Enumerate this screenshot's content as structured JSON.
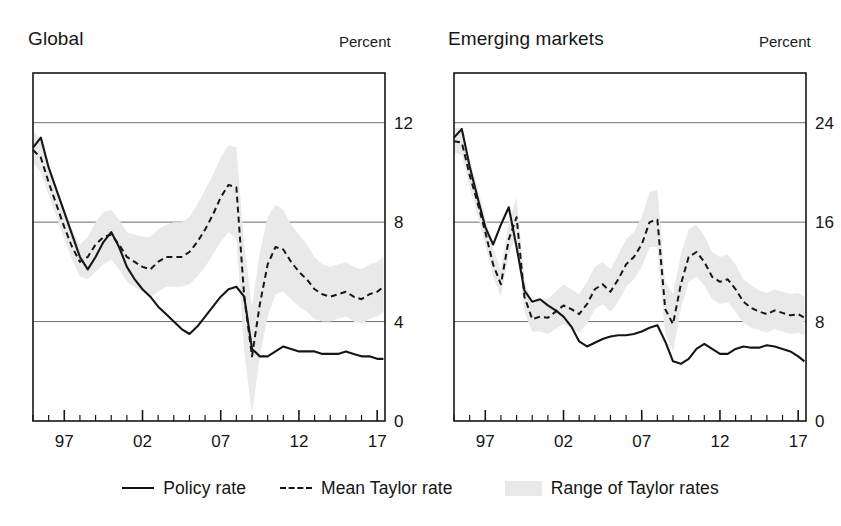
{
  "figure": {
    "background": "#ffffff",
    "ink": "#161616",
    "band_color": "#e9e9e9",
    "gridline_color": "#6e6e6e"
  },
  "panels": [
    {
      "id": "global",
      "title": "Global",
      "unit_label": "Percent",
      "y_ticks": [
        "0",
        "4",
        "8",
        "12"
      ],
      "x_ticks": [
        "97",
        "02",
        "07",
        "12",
        "17"
      ]
    },
    {
      "id": "emerging-markets",
      "title": "Emerging markets",
      "unit_label": "Percent",
      "y_ticks": [
        "0",
        "8",
        "16",
        "24"
      ],
      "x_ticks": [
        "97",
        "02",
        "07",
        "12",
        "17"
      ]
    }
  ],
  "legend": {
    "items": [
      {
        "key": "policy-rate",
        "label": "Policy rate",
        "marker": "solid-line"
      },
      {
        "key": "mean-taylor-rate",
        "label": "Mean Taylor rate",
        "marker": "dashed-line"
      },
      {
        "key": "range-taylor-rates",
        "label": "Range of Taylor rates",
        "marker": "shaded-band"
      }
    ]
  },
  "chart_data": [
    {
      "type": "line",
      "id": "global",
      "title": "Global",
      "xlabel": "",
      "ylabel": "Percent",
      "xlim": [
        1995.0,
        2017.5
      ],
      "ylim": [
        0,
        14
      ],
      "ytick_values": [
        0,
        4,
        8,
        12
      ],
      "ytick_labels": [
        "0",
        "4",
        "8",
        "12"
      ],
      "xtick_values": [
        1997,
        2002,
        2007,
        2012,
        2017
      ],
      "xtick_labels": [
        "97",
        "02",
        "07",
        "12",
        "17"
      ],
      "minor_xtick_step": 1,
      "grid": "horizontal",
      "legend_position": "below-figure",
      "x": [
        1995.0,
        1995.5,
        1996.0,
        1996.5,
        1997.0,
        1997.5,
        1998.0,
        1998.5,
        1999.0,
        1999.5,
        2000.0,
        2000.5,
        2001.0,
        2001.5,
        2002.0,
        2002.5,
        2003.0,
        2003.5,
        2004.0,
        2004.5,
        2005.0,
        2005.5,
        2006.0,
        2006.5,
        2007.0,
        2007.5,
        2008.0,
        2008.5,
        2009.0,
        2009.5,
        2010.0,
        2010.5,
        2011.0,
        2011.5,
        2012.0,
        2012.5,
        2013.0,
        2013.5,
        2014.0,
        2014.5,
        2015.0,
        2015.5,
        2016.0,
        2016.5,
        2017.0,
        2017.4
      ],
      "series": [
        {
          "name": "Policy rate",
          "style": "solid",
          "values": [
            11.0,
            11.4,
            10.2,
            9.3,
            8.4,
            7.5,
            6.6,
            6.1,
            6.6,
            7.2,
            7.6,
            7.0,
            6.2,
            5.7,
            5.3,
            5.0,
            4.6,
            4.3,
            4.0,
            3.7,
            3.5,
            3.8,
            4.2,
            4.6,
            5.0,
            5.3,
            5.4,
            5.0,
            2.9,
            2.6,
            2.6,
            2.8,
            3.0,
            2.9,
            2.8,
            2.8,
            2.8,
            2.7,
            2.7,
            2.7,
            2.8,
            2.7,
            2.6,
            2.6,
            2.5,
            2.5
          ]
        },
        {
          "name": "Mean Taylor rate",
          "style": "dashed",
          "values": [
            10.9,
            10.6,
            9.6,
            8.7,
            7.8,
            7.0,
            6.4,
            6.6,
            7.1,
            7.4,
            7.5,
            7.1,
            6.6,
            6.4,
            6.2,
            6.1,
            6.4,
            6.6,
            6.6,
            6.6,
            6.8,
            7.2,
            7.7,
            8.3,
            9.0,
            9.5,
            9.4,
            5.0,
            2.6,
            4.7,
            6.3,
            7.0,
            6.9,
            6.4,
            6.0,
            5.7,
            5.3,
            5.1,
            5.0,
            5.1,
            5.2,
            5.0,
            4.9,
            5.1,
            5.2,
            5.4
          ]
        }
      ],
      "band": {
        "name": "Range of Taylor rates",
        "color": "#e9e9e9",
        "lower": [
          10.4,
          10.0,
          9.1,
          8.2,
          7.3,
          6.5,
          5.8,
          5.7,
          6.0,
          6.3,
          6.5,
          6.1,
          5.6,
          5.4,
          5.2,
          5.0,
          5.2,
          5.4,
          5.4,
          5.4,
          5.5,
          5.8,
          6.2,
          6.7,
          7.2,
          7.6,
          7.3,
          2.8,
          0.3,
          2.6,
          4.2,
          5.1,
          5.2,
          4.9,
          4.6,
          4.4,
          4.1,
          4.0,
          4.0,
          4.1,
          4.2,
          4.0,
          3.9,
          4.1,
          4.2,
          4.4
        ],
        "upper": [
          11.7,
          11.3,
          10.3,
          9.4,
          8.5,
          7.7,
          7.1,
          7.4,
          8.0,
          8.4,
          8.5,
          8.1,
          7.6,
          7.5,
          7.4,
          7.4,
          7.7,
          7.9,
          8.0,
          8.0,
          8.2,
          8.7,
          9.3,
          9.9,
          10.6,
          11.1,
          11.0,
          7.1,
          4.6,
          6.8,
          8.2,
          8.7,
          8.5,
          7.9,
          7.5,
          7.1,
          6.6,
          6.3,
          6.2,
          6.3,
          6.4,
          6.2,
          6.1,
          6.3,
          6.4,
          6.6
        ]
      }
    },
    {
      "type": "line",
      "id": "emerging-markets",
      "title": "Emerging markets",
      "xlabel": "",
      "ylabel": "Percent",
      "xlim": [
        1995.0,
        2017.5
      ],
      "ylim": [
        0,
        28
      ],
      "ytick_values": [
        0,
        8,
        16,
        24
      ],
      "ytick_labels": [
        "0",
        "8",
        "16",
        "24"
      ],
      "xtick_values": [
        1997,
        2002,
        2007,
        2012,
        2017
      ],
      "xtick_labels": [
        "97",
        "02",
        "07",
        "12",
        "17"
      ],
      "minor_xtick_step": 1,
      "grid": "horizontal",
      "legend_position": "below-figure",
      "x": [
        1995.0,
        1995.5,
        1996.0,
        1996.5,
        1997.0,
        1997.5,
        1998.0,
        1998.5,
        1999.0,
        1999.5,
        2000.0,
        2000.5,
        2001.0,
        2001.5,
        2002.0,
        2002.5,
        2003.0,
        2003.5,
        2004.0,
        2004.5,
        2005.0,
        2005.5,
        2006.0,
        2006.5,
        2007.0,
        2007.5,
        2008.0,
        2008.5,
        2009.0,
        2009.5,
        2010.0,
        2010.5,
        2011.0,
        2011.5,
        2012.0,
        2012.5,
        2013.0,
        2013.5,
        2014.0,
        2014.5,
        2015.0,
        2015.5,
        2016.0,
        2016.5,
        2017.0,
        2017.4
      ],
      "series": [
        {
          "name": "Policy rate",
          "style": "solid",
          "values": [
            22.8,
            23.5,
            20.5,
            18.0,
            15.6,
            14.2,
            15.8,
            17.2,
            14.0,
            10.5,
            9.6,
            9.8,
            9.3,
            8.9,
            8.4,
            7.6,
            6.4,
            6.0,
            6.3,
            6.6,
            6.8,
            6.9,
            6.9,
            7.0,
            7.2,
            7.5,
            7.7,
            6.4,
            4.8,
            4.6,
            5.0,
            5.8,
            6.2,
            5.8,
            5.4,
            5.4,
            5.8,
            6.0,
            5.9,
            5.9,
            6.1,
            6.0,
            5.8,
            5.6,
            5.2,
            4.8
          ]
        },
        {
          "name": "Mean Taylor rate",
          "style": "dashed",
          "values": [
            22.5,
            22.4,
            19.8,
            17.6,
            15.2,
            12.6,
            11.0,
            14.6,
            16.4,
            10.0,
            8.2,
            8.4,
            8.3,
            8.8,
            9.3,
            9.0,
            8.6,
            9.4,
            10.6,
            11.0,
            10.4,
            11.4,
            12.6,
            13.2,
            14.2,
            16.0,
            16.2,
            9.0,
            7.8,
            11.0,
            13.2,
            13.6,
            12.8,
            11.6,
            11.2,
            11.4,
            10.6,
            9.6,
            9.1,
            8.8,
            8.6,
            8.9,
            8.7,
            8.5,
            8.6,
            8.3
          ]
        }
      ],
      "band": {
        "name": "Range of Taylor rates",
        "color": "#e9e9e9",
        "lower": [
          21.6,
          21.4,
          18.8,
          16.6,
          14.2,
          11.6,
          10.0,
          13.4,
          15.0,
          8.8,
          7.2,
          7.2,
          7.0,
          7.4,
          7.8,
          7.5,
          7.1,
          7.8,
          9.0,
          9.4,
          8.8,
          9.6,
          10.8,
          11.4,
          12.4,
          14.0,
          14.0,
          7.0,
          5.6,
          9.0,
          11.2,
          11.6,
          10.9,
          9.8,
          9.4,
          9.6,
          8.8,
          7.9,
          7.5,
          7.3,
          7.1,
          7.4,
          7.2,
          7.0,
          7.1,
          6.9
        ],
        "upper": [
          23.6,
          23.6,
          21.0,
          18.8,
          16.4,
          13.8,
          12.2,
          16.0,
          18.0,
          11.4,
          9.4,
          9.8,
          9.8,
          10.4,
          11.0,
          10.6,
          10.2,
          11.2,
          12.4,
          12.8,
          12.2,
          13.4,
          14.6,
          15.2,
          16.4,
          18.4,
          18.6,
          11.2,
          10.2,
          13.4,
          15.4,
          15.8,
          14.9,
          13.6,
          13.2,
          13.4,
          12.6,
          11.4,
          10.9,
          10.5,
          10.3,
          10.6,
          10.4,
          10.2,
          10.3,
          10.0
        ]
      }
    }
  ]
}
